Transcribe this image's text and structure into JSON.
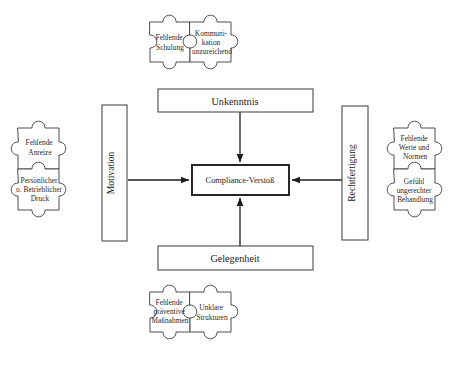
{
  "diagram": {
    "background_color": "#ffffff",
    "line_color": "#1d1d1d",
    "piece_stroke_color": "#3a3a3a"
  },
  "core": {
    "label": "Compliance-Verstoß"
  },
  "boxes": {
    "top": {
      "label": "Unkenntnis"
    },
    "bottom": {
      "label": "Gelegenheit"
    },
    "left": {
      "label": "Motivation"
    },
    "right": {
      "label": "Rechtfertigung"
    }
  },
  "pieces": {
    "top": [
      {
        "lines": [
          "Fehlende",
          "Schulung"
        ]
      },
      {
        "lines": [
          "Kommuni-",
          "kation",
          "unzureichend"
        ]
      }
    ],
    "left": [
      {
        "lines": [
          "Fehlende",
          "Anreize"
        ]
      },
      {
        "lines": [
          "Persönlicher",
          "o. Betrieblicher",
          "Druck"
        ]
      }
    ],
    "right": [
      {
        "lines": [
          "Fehlende",
          "Werte und",
          "Normen"
        ]
      },
      {
        "lines": [
          "Gefühl",
          "ungerechter",
          "Behandlung"
        ]
      }
    ],
    "bottom": [
      {
        "lines": [
          "Fehlende",
          "präventive",
          "Maßnahmen"
        ]
      },
      {
        "lines": [
          "Unklare",
          "Strukturen"
        ]
      }
    ]
  },
  "arrows": [
    {
      "name": "unkenntnis-to-core",
      "direction": "down"
    },
    {
      "name": "gelegenheit-to-core",
      "direction": "up"
    },
    {
      "name": "motivation-to-core",
      "direction": "right"
    },
    {
      "name": "rechtfertigung-to-core",
      "direction": "left"
    }
  ]
}
